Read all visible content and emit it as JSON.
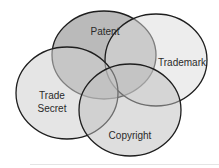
{
  "diagram": {
    "type": "venn",
    "sets": [
      {
        "id": "patent",
        "label": "Patent",
        "cx": 104,
        "cy": 55,
        "rx": 52,
        "ry": 44,
        "fill": "#8c8c8c",
        "opacity": 0.6
      },
      {
        "id": "trademark",
        "label": "Trademark",
        "cx": 156,
        "cy": 60,
        "rx": 51,
        "ry": 46,
        "fill": "#dcdcdc",
        "opacity": 0.5
      },
      {
        "id": "trade-secret",
        "label": "Trade Secret",
        "line1": "Trade",
        "line2": "Secret",
        "cx": 67,
        "cy": 93,
        "rx": 51,
        "ry": 46,
        "fill": "#cfcfcf",
        "opacity": 0.55
      },
      {
        "id": "copyright",
        "label": "Copyright",
        "cx": 130,
        "cy": 110,
        "rx": 51,
        "ry": 46,
        "fill": "#bdbdbd",
        "opacity": 0.5
      }
    ],
    "stroke": "#1e1e1e"
  }
}
